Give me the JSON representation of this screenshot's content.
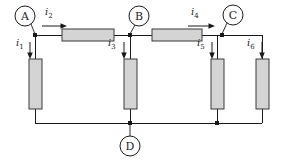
{
  "diagram": {
    "type": "electrical-circuit-schematic",
    "background_color": "#ffffff",
    "wire_color": "#1a1a1a",
    "resistor_fill": "#d4d4d4",
    "resistor_stroke": "#3a3a3a"
  },
  "nodes": [
    {
      "id": "A",
      "label": "A",
      "circle_cx": 25,
      "circle_cy": 16,
      "circle_r": 10,
      "junction_x": 35,
      "junction_y": 35,
      "position": "above-left-of-junction"
    },
    {
      "id": "B",
      "label": "B",
      "circle_cx": 137,
      "circle_cy": 16,
      "circle_r": 10,
      "junction_x": 130,
      "junction_y": 35,
      "position": "above-junction"
    },
    {
      "id": "C",
      "label": "C",
      "circle_cx": 233,
      "circle_cy": 16,
      "circle_r": 10,
      "junction_x": 222,
      "junction_y": 35,
      "position": "above-right-of-junction"
    },
    {
      "id": "D",
      "label": "D",
      "circle_cx": 130,
      "circle_cy": 146,
      "circle_r": 10,
      "junction_x": 130,
      "junction_y": 123,
      "position": "below-junction"
    }
  ],
  "currents": [
    {
      "id": "i1",
      "label": "i",
      "subscript": "1",
      "direction": "down",
      "label_x": 18,
      "label_y": 41,
      "arrow_x": 30,
      "arrow_y1": 42,
      "arrow_y2": 57
    },
    {
      "id": "i2",
      "label": "i",
      "subscript": "2",
      "direction": "right",
      "label_x": 46,
      "label_y": 8,
      "arrow_y": 26,
      "arrow_x1": 42,
      "arrow_x2": 66
    },
    {
      "id": "i3",
      "label": "i",
      "subscript": "3",
      "direction": "down",
      "label_x": 109,
      "label_y": 41,
      "arrow_x": 124,
      "arrow_y1": 42,
      "arrow_y2": 57
    },
    {
      "id": "i4",
      "label": "i",
      "subscript": "4",
      "direction": "right",
      "label_x": 192,
      "label_y": 8,
      "arrow_y": 26,
      "arrow_x1": 188,
      "arrow_x2": 214
    },
    {
      "id": "i5",
      "label": "i",
      "subscript": "5",
      "direction": "down",
      "label_x": 196,
      "label_y": 41,
      "arrow_x": 212,
      "arrow_y1": 42,
      "arrow_y2": 57
    },
    {
      "id": "i6",
      "label": "i",
      "subscript": "6",
      "direction": "down",
      "label_x": 246,
      "label_y": 41,
      "arrow_x": 262,
      "arrow_y1": 42,
      "arrow_y2": 57
    }
  ],
  "resistors": [
    {
      "id": "R-A-B",
      "orientation": "horizontal",
      "x": 62,
      "y": 29,
      "width": 52,
      "height": 12,
      "between": [
        "A",
        "B"
      ]
    },
    {
      "id": "R-B-C",
      "orientation": "horizontal",
      "x": 152,
      "y": 29,
      "width": 50,
      "height": 12,
      "between": [
        "B",
        "C"
      ]
    },
    {
      "id": "R-A-D",
      "orientation": "vertical",
      "x": 29,
      "y": 59,
      "width": 13,
      "height": 50,
      "between": [
        "A",
        "D"
      ]
    },
    {
      "id": "R-B-D",
      "orientation": "vertical",
      "x": 124,
      "y": 59,
      "width": 13,
      "height": 50,
      "between": [
        "B",
        "D"
      ]
    },
    {
      "id": "R-C-D",
      "orientation": "vertical",
      "x": 211,
      "y": 59,
      "width": 13,
      "height": 50,
      "between": [
        "C",
        "D"
      ]
    },
    {
      "id": "R-right",
      "orientation": "vertical",
      "x": 256,
      "y": 59,
      "width": 13,
      "height": 50,
      "between": [
        "C",
        "D"
      ]
    }
  ],
  "junction_dots": [
    {
      "x": 35,
      "y": 35
    },
    {
      "x": 130,
      "y": 35
    },
    {
      "x": 222,
      "y": 35
    },
    {
      "x": 130,
      "y": 123
    },
    {
      "x": 217,
      "y": 123
    }
  ],
  "wire_paths": {
    "top_left_segment": "M35,35 L62,35",
    "top_mid_segment": "M114,35 L152,35",
    "top_right_segment": "M202,35 L262,35",
    "bottom_rail": "M35,123 L262,123",
    "branch_a_top": "M35,35 L35,59",
    "branch_a_bottom": "M35,109 L35,123",
    "branch_b_top": "M130,35 L130,59",
    "branch_b_bottom": "M130,109 L130,123",
    "branch_c_top": "M217,35 L217,59",
    "branch_c_bottom": "M217,109 L217,123",
    "branch_r_top": "M262,35 L262,59",
    "branch_r_bottom": "M262,109 L262,123"
  }
}
